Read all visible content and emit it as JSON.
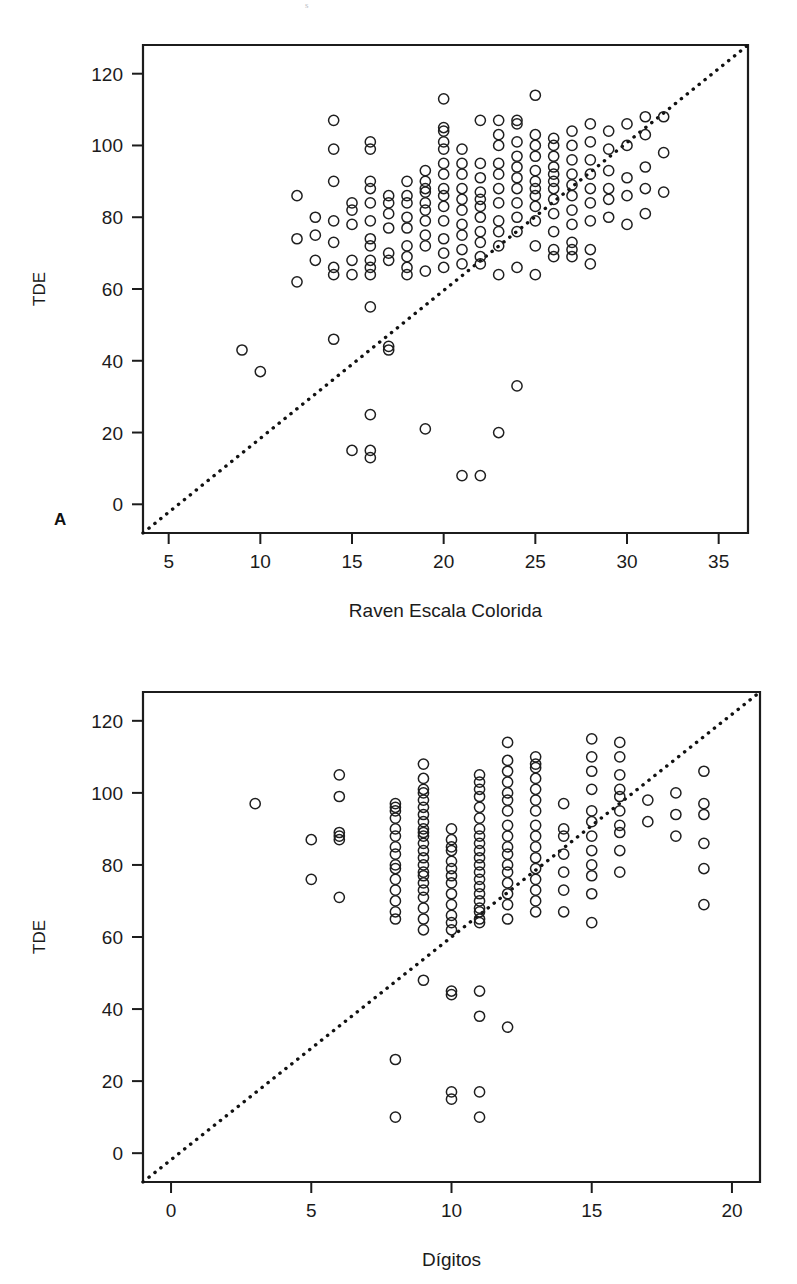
{
  "figure": {
    "background": "#ffffff",
    "ink_color": "#1b1b1b",
    "marker_style": "open-circle",
    "reference_line_style": "dotted-identity-line",
    "top_artifact": "s"
  },
  "panels": [
    {
      "letter": "A",
      "y_axis_title": "TDE",
      "x_axis_title": "Raven Escala Colorida"
    },
    {
      "letter": "B",
      "y_axis_title": "TDE",
      "x_axis_title": "Dígitos"
    }
  ],
  "chart_data": [
    {
      "type": "scatter",
      "panel": "A",
      "title": "",
      "xlabel": "Raven Escala Colorida",
      "ylabel": "TDE",
      "xlim": [
        3.6,
        36.6
      ],
      "ylim": [
        -8,
        128
      ],
      "xticks": [
        5,
        10,
        15,
        20,
        25,
        30,
        35
      ],
      "xtick_labels": [
        "5",
        "10",
        "15",
        "20",
        "25",
        "30",
        "35"
      ],
      "yticks": [
        0,
        20,
        40,
        60,
        80,
        100,
        120
      ],
      "ytick_labels": [
        "0",
        "20",
        "40",
        "60",
        "80",
        "100",
        "120"
      ],
      "grid": false,
      "legend": "none",
      "annotations": [
        {
          "type": "line",
          "name": "identity-reference-line",
          "style": "dotted",
          "from": [
            3.6,
            -8
          ],
          "to": [
            36.6,
            128
          ]
        }
      ],
      "points": [
        [
          9,
          43
        ],
        [
          10,
          37
        ],
        [
          12,
          62
        ],
        [
          12,
          74
        ],
        [
          12,
          86
        ],
        [
          13,
          68
        ],
        [
          13,
          75
        ],
        [
          13,
          80
        ],
        [
          14,
          46
        ],
        [
          14,
          64
        ],
        [
          14,
          66
        ],
        [
          14,
          73
        ],
        [
          14,
          79
        ],
        [
          14,
          90
        ],
        [
          14,
          99
        ],
        [
          14,
          107
        ],
        [
          15,
          15
        ],
        [
          15,
          64
        ],
        [
          15,
          68
        ],
        [
          15,
          78
        ],
        [
          15,
          82
        ],
        [
          15,
          84
        ],
        [
          16,
          13
        ],
        [
          16,
          15
        ],
        [
          16,
          25
        ],
        [
          16,
          55
        ],
        [
          16,
          64
        ],
        [
          16,
          66
        ],
        [
          16,
          68
        ],
        [
          16,
          72
        ],
        [
          16,
          74
        ],
        [
          16,
          79
        ],
        [
          16,
          84
        ],
        [
          16,
          88
        ],
        [
          16,
          90
        ],
        [
          16,
          99
        ],
        [
          16,
          101
        ],
        [
          17,
          43
        ],
        [
          17,
          44
        ],
        [
          17,
          68
        ],
        [
          17,
          70
        ],
        [
          17,
          77
        ],
        [
          17,
          81
        ],
        [
          17,
          84
        ],
        [
          17,
          86
        ],
        [
          18,
          64
        ],
        [
          18,
          66
        ],
        [
          18,
          69
        ],
        [
          18,
          72
        ],
        [
          18,
          77
        ],
        [
          18,
          80
        ],
        [
          18,
          84
        ],
        [
          18,
          86
        ],
        [
          18,
          90
        ],
        [
          19,
          21
        ],
        [
          19,
          65
        ],
        [
          19,
          72
        ],
        [
          19,
          75
        ],
        [
          19,
          79
        ],
        [
          19,
          82
        ],
        [
          19,
          84
        ],
        [
          19,
          87
        ],
        [
          19,
          88
        ],
        [
          19,
          90
        ],
        [
          19,
          93
        ],
        [
          20,
          66
        ],
        [
          20,
          70
        ],
        [
          20,
          74
        ],
        [
          20,
          79
        ],
        [
          20,
          83
        ],
        [
          20,
          86
        ],
        [
          20,
          88
        ],
        [
          20,
          92
        ],
        [
          20,
          95
        ],
        [
          20,
          99
        ],
        [
          20,
          101
        ],
        [
          20,
          104
        ],
        [
          20,
          105
        ],
        [
          20,
          113
        ],
        [
          21,
          8
        ],
        [
          21,
          67
        ],
        [
          21,
          71
        ],
        [
          21,
          75
        ],
        [
          21,
          78
        ],
        [
          21,
          82
        ],
        [
          21,
          85
        ],
        [
          21,
          88
        ],
        [
          21,
          92
        ],
        [
          21,
          95
        ],
        [
          21,
          99
        ],
        [
          22,
          8
        ],
        [
          22,
          67
        ],
        [
          22,
          69
        ],
        [
          22,
          73
        ],
        [
          22,
          76
        ],
        [
          22,
          80
        ],
        [
          22,
          83
        ],
        [
          22,
          85
        ],
        [
          22,
          87
        ],
        [
          22,
          91
        ],
        [
          22,
          95
        ],
        [
          22,
          107
        ],
        [
          23,
          20
        ],
        [
          23,
          64
        ],
        [
          23,
          72
        ],
        [
          23,
          76
        ],
        [
          23,
          79
        ],
        [
          23,
          84
        ],
        [
          23,
          88
        ],
        [
          23,
          92
        ],
        [
          23,
          95
        ],
        [
          23,
          100
        ],
        [
          23,
          103
        ],
        [
          23,
          107
        ],
        [
          24,
          33
        ],
        [
          24,
          66
        ],
        [
          24,
          76
        ],
        [
          24,
          80
        ],
        [
          24,
          84
        ],
        [
          24,
          88
        ],
        [
          24,
          91
        ],
        [
          24,
          94
        ],
        [
          24,
          97
        ],
        [
          24,
          101
        ],
        [
          24,
          106
        ],
        [
          24,
          107
        ],
        [
          25,
          64
        ],
        [
          25,
          72
        ],
        [
          25,
          79
        ],
        [
          25,
          83
        ],
        [
          25,
          86
        ],
        [
          25,
          88
        ],
        [
          25,
          90
        ],
        [
          25,
          93
        ],
        [
          25,
          97
        ],
        [
          25,
          100
        ],
        [
          25,
          103
        ],
        [
          25,
          114
        ],
        [
          26,
          69
        ],
        [
          26,
          71
        ],
        [
          26,
          76
        ],
        [
          26,
          81
        ],
        [
          26,
          85
        ],
        [
          26,
          88
        ],
        [
          26,
          90
        ],
        [
          26,
          92
        ],
        [
          26,
          94
        ],
        [
          26,
          97
        ],
        [
          26,
          100
        ],
        [
          26,
          102
        ],
        [
          27,
          69
        ],
        [
          27,
          71
        ],
        [
          27,
          73
        ],
        [
          27,
          78
        ],
        [
          27,
          82
        ],
        [
          27,
          86
        ],
        [
          27,
          89
        ],
        [
          27,
          92
        ],
        [
          27,
          96
        ],
        [
          27,
          100
        ],
        [
          27,
          104
        ],
        [
          28,
          67
        ],
        [
          28,
          71
        ],
        [
          28,
          79
        ],
        [
          28,
          84
        ],
        [
          28,
          88
        ],
        [
          28,
          92
        ],
        [
          28,
          96
        ],
        [
          28,
          101
        ],
        [
          28,
          106
        ],
        [
          29,
          80
        ],
        [
          29,
          85
        ],
        [
          29,
          88
        ],
        [
          29,
          93
        ],
        [
          29,
          99
        ],
        [
          29,
          104
        ],
        [
          30,
          78
        ],
        [
          30,
          86
        ],
        [
          30,
          91
        ],
        [
          30,
          100
        ],
        [
          30,
          106
        ],
        [
          31,
          81
        ],
        [
          31,
          88
        ],
        [
          31,
          94
        ],
        [
          31,
          103
        ],
        [
          31,
          108
        ],
        [
          32,
          87
        ],
        [
          32,
          98
        ],
        [
          32,
          108
        ]
      ]
    },
    {
      "type": "scatter",
      "panel": "B",
      "title": "",
      "xlabel": "Dígitos",
      "ylabel": "TDE",
      "xlim": [
        -1.0,
        21.0
      ],
      "ylim": [
        -8,
        128
      ],
      "xticks": [
        0,
        5,
        10,
        15,
        20
      ],
      "xtick_labels": [
        "0",
        "5",
        "10",
        "15",
        "20"
      ],
      "yticks": [
        0,
        20,
        40,
        60,
        80,
        100,
        120
      ],
      "ytick_labels": [
        "0",
        "20",
        "40",
        "60",
        "80",
        "100",
        "120"
      ],
      "grid": false,
      "legend": "none",
      "annotations": [
        {
          "type": "line",
          "name": "identity-reference-line",
          "style": "dotted",
          "from": [
            -1.0,
            -8
          ],
          "to": [
            21.0,
            128
          ]
        }
      ],
      "points": [
        [
          3,
          97
        ],
        [
          5,
          76
        ],
        [
          5,
          87
        ],
        [
          6,
          71
        ],
        [
          6,
          87
        ],
        [
          6,
          88
        ],
        [
          6,
          89
        ],
        [
          6,
          99
        ],
        [
          6,
          105
        ],
        [
          8,
          10
        ],
        [
          8,
          26
        ],
        [
          8,
          65
        ],
        [
          8,
          67
        ],
        [
          8,
          70
        ],
        [
          8,
          73
        ],
        [
          8,
          76
        ],
        [
          8,
          79
        ],
        [
          8,
          80
        ],
        [
          8,
          83
        ],
        [
          8,
          85
        ],
        [
          8,
          88
        ],
        [
          8,
          90
        ],
        [
          8,
          93
        ],
        [
          8,
          95
        ],
        [
          8,
          96
        ],
        [
          8,
          97
        ],
        [
          9,
          48
        ],
        [
          9,
          62
        ],
        [
          9,
          65
        ],
        [
          9,
          68
        ],
        [
          9,
          71
        ],
        [
          9,
          73
        ],
        [
          9,
          75
        ],
        [
          9,
          77
        ],
        [
          9,
          78
        ],
        [
          9,
          80
        ],
        [
          9,
          82
        ],
        [
          9,
          84
        ],
        [
          9,
          86
        ],
        [
          9,
          88
        ],
        [
          9,
          89
        ],
        [
          9,
          90
        ],
        [
          9,
          92
        ],
        [
          9,
          94
        ],
        [
          9,
          96
        ],
        [
          9,
          98
        ],
        [
          9,
          100
        ],
        [
          9,
          101
        ],
        [
          9,
          104
        ],
        [
          9,
          108
        ],
        [
          10,
          15
        ],
        [
          10,
          17
        ],
        [
          10,
          44
        ],
        [
          10,
          45
        ],
        [
          10,
          62
        ],
        [
          10,
          64
        ],
        [
          10,
          66
        ],
        [
          10,
          69
        ],
        [
          10,
          72
        ],
        [
          10,
          75
        ],
        [
          10,
          77
        ],
        [
          10,
          79
        ],
        [
          10,
          81
        ],
        [
          10,
          84
        ],
        [
          10,
          85
        ],
        [
          10,
          87
        ],
        [
          10,
          90
        ],
        [
          11,
          10
        ],
        [
          11,
          17
        ],
        [
          11,
          38
        ],
        [
          11,
          45
        ],
        [
          11,
          64
        ],
        [
          11,
          65
        ],
        [
          11,
          67
        ],
        [
          11,
          68
        ],
        [
          11,
          70
        ],
        [
          11,
          72
        ],
        [
          11,
          74
        ],
        [
          11,
          76
        ],
        [
          11,
          78
        ],
        [
          11,
          80
        ],
        [
          11,
          82
        ],
        [
          11,
          84
        ],
        [
          11,
          86
        ],
        [
          11,
          88
        ],
        [
          11,
          90
        ],
        [
          11,
          93
        ],
        [
          11,
          96
        ],
        [
          11,
          99
        ],
        [
          11,
          101
        ],
        [
          11,
          103
        ],
        [
          11,
          105
        ],
        [
          12,
          35
        ],
        [
          12,
          65
        ],
        [
          12,
          69
        ],
        [
          12,
          72
        ],
        [
          12,
          75
        ],
        [
          12,
          78
        ],
        [
          12,
          80
        ],
        [
          12,
          83
        ],
        [
          12,
          85
        ],
        [
          12,
          88
        ],
        [
          12,
          91
        ],
        [
          12,
          95
        ],
        [
          12,
          98
        ],
        [
          12,
          100
        ],
        [
          12,
          103
        ],
        [
          12,
          106
        ],
        [
          12,
          109
        ],
        [
          12,
          114
        ],
        [
          13,
          67
        ],
        [
          13,
          70
        ],
        [
          13,
          73
        ],
        [
          13,
          76
        ],
        [
          13,
          79
        ],
        [
          13,
          82
        ],
        [
          13,
          85
        ],
        [
          13,
          88
        ],
        [
          13,
          91
        ],
        [
          13,
          95
        ],
        [
          13,
          98
        ],
        [
          13,
          101
        ],
        [
          13,
          104
        ],
        [
          13,
          107
        ],
        [
          13,
          108
        ],
        [
          13,
          110
        ],
        [
          14,
          67
        ],
        [
          14,
          73
        ],
        [
          14,
          78
        ],
        [
          14,
          83
        ],
        [
          14,
          88
        ],
        [
          14,
          90
        ],
        [
          14,
          97
        ],
        [
          15,
          64
        ],
        [
          15,
          72
        ],
        [
          15,
          77
        ],
        [
          15,
          80
        ],
        [
          15,
          84
        ],
        [
          15,
          88
        ],
        [
          15,
          92
        ],
        [
          15,
          95
        ],
        [
          15,
          101
        ],
        [
          15,
          106
        ],
        [
          15,
          110
        ],
        [
          15,
          115
        ],
        [
          16,
          78
        ],
        [
          16,
          84
        ],
        [
          16,
          89
        ],
        [
          16,
          91
        ],
        [
          16,
          95
        ],
        [
          16,
          99
        ],
        [
          16,
          101
        ],
        [
          16,
          105
        ],
        [
          16,
          110
        ],
        [
          16,
          114
        ],
        [
          17,
          92
        ],
        [
          17,
          98
        ],
        [
          18,
          88
        ],
        [
          18,
          94
        ],
        [
          18,
          100
        ],
        [
          19,
          69
        ],
        [
          19,
          79
        ],
        [
          19,
          86
        ],
        [
          19,
          94
        ],
        [
          19,
          97
        ],
        [
          19,
          106
        ]
      ]
    }
  ]
}
